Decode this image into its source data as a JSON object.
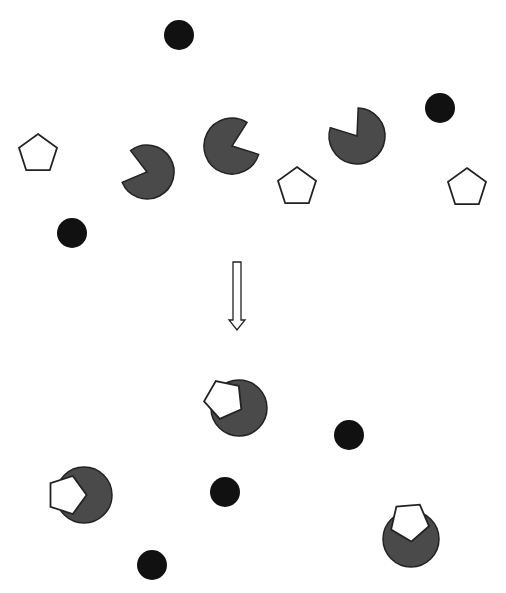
{
  "diagram": {
    "colors": {
      "background": "#ffffff",
      "black_dot": "#111111",
      "pacman_fill": "#4a4a4a",
      "outline": "#222222",
      "pentagon_fill": "#ffffff"
    },
    "before": {
      "black_dots": [
        {
          "cx": 179,
          "cy": 35,
          "r": 15
        },
        {
          "cx": 440,
          "cy": 108,
          "r": 15
        },
        {
          "cx": 72,
          "cy": 233,
          "r": 15
        }
      ],
      "pentagons": [
        {
          "cx": 38,
          "cy": 154,
          "r": 20,
          "rot": 0
        },
        {
          "cx": 297,
          "cy": 187,
          "r": 20,
          "rot": 0
        },
        {
          "cx": 467,
          "cy": 188,
          "r": 20,
          "rot": 0
        }
      ],
      "pacmen": [
        {
          "cx": 147,
          "cy": 172,
          "r": 27,
          "mouth_center_deg": 195,
          "mouth_width_deg": 75
        },
        {
          "cx": 232,
          "cy": 146,
          "r": 28,
          "mouth_center_deg": 340,
          "mouth_width_deg": 75
        },
        {
          "cx": 357,
          "cy": 136,
          "r": 28,
          "mouth_center_deg": 235,
          "mouth_width_deg": 75
        }
      ]
    },
    "arrow": {
      "label": "down-arrow",
      "x": 237,
      "y_top": 262,
      "y_bottom": 330
    },
    "after": {
      "black_dots": [
        {
          "cx": 225,
          "cy": 492,
          "r": 15
        },
        {
          "cx": 349,
          "cy": 435,
          "r": 15
        },
        {
          "cx": 152,
          "cy": 565,
          "r": 15
        }
      ],
      "assemblies": [
        {
          "cx": 239,
          "cy": 408,
          "r": 28,
          "pentagon_angle_deg": 210
        },
        {
          "cx": 84,
          "cy": 495,
          "r": 28,
          "pentagon_angle_deg": 180
        },
        {
          "cx": 411,
          "cy": 539,
          "r": 28,
          "pentagon_angle_deg": 265
        }
      ]
    }
  }
}
